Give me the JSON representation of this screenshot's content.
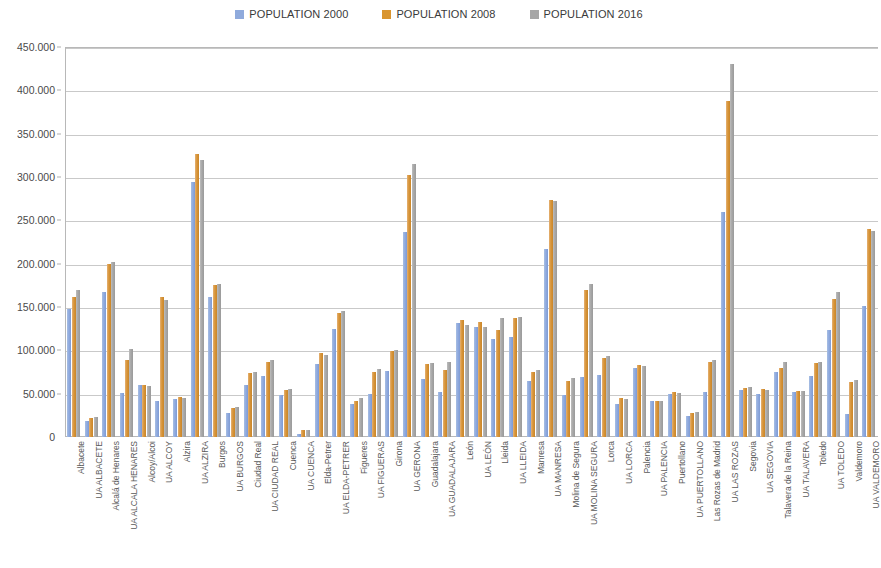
{
  "legend": {
    "position": "top-center",
    "entries": [
      {
        "label": "POPULATION 2000",
        "color": "#8FAADC"
      },
      {
        "label": "POPULATION 2008",
        "color": "#D9952F"
      },
      {
        "label": "POPULATION 2016",
        "color": "#A6A6A6"
      }
    ]
  },
  "axis": {
    "y_ticks": [
      "0",
      "50.000",
      "100.000",
      "150.000",
      "200.000",
      "250.000",
      "300.000",
      "350.000",
      "400.000",
      "450.000"
    ]
  },
  "chart_data": {
    "type": "bar",
    "title": "",
    "subtitle": "",
    "xlabel": "",
    "ylabel": "",
    "ylim": [
      0,
      450000
    ],
    "ytick_step": 50000,
    "grid": true,
    "legend_position": "top-center",
    "note": "Grouped (clustered) column chart. Spanish urban areas (UA = Urban Area) with population for three census years. Rightmost group UA VALDEMORO is clipped by the image edge.",
    "categories": [
      "Albacete",
      "UA ALBACETE",
      "Alcalá de Henares",
      "UA ALCALA HENARES",
      "Alcoy/Alcoi",
      "UA ALCOY",
      "Alzira",
      "UA ALZIRA",
      "Burgos",
      "UA BURGOS",
      "Ciudad Real",
      "UA CIUDAD REAL",
      "Cuenca",
      "UA CUENCA",
      "Elda-Petrer",
      "UA ELDA-PETRER",
      "Figueres",
      "UA FIGUERAS",
      "Girona",
      "UA GERONA",
      "Guadalajara",
      "UA GUADALAJARA",
      "León",
      "UA LEÓN",
      "Lleida",
      "UA LLEIDA",
      "Manresa",
      "UA MANRESA",
      "Molina de Segura",
      "UA MOLINA SEGURA",
      "Lorca",
      "UA LORCA",
      "Palencia",
      "UA PALENCIA",
      "Puertollano",
      "UA PUERTOLLANO",
      "Las Rozas de Madrid",
      "UA LAS ROZAS",
      "Segovia",
      "UA SEGOVIA",
      "Talavera de la Reina",
      "UA TALAVERA",
      "Toledo",
      "UA TOLEDO",
      "Valdemoro",
      "UA VALDEMORO"
    ],
    "series": [
      {
        "name": "POPULATION 2000",
        "color": "#8FAADC",
        "values": [
          148000,
          18000,
          167000,
          51000,
          60000,
          42000,
          44000,
          294000,
          162000,
          28000,
          60000,
          70000,
          48000,
          4000,
          84000,
          125000,
          38000,
          50000,
          76000,
          236000,
          67000,
          52000,
          131000,
          127000,
          113000,
          115000,
          65000,
          217000,
          48000,
          69000,
          72000,
          38000,
          80000,
          42000,
          50000,
          24000,
          52000,
          260000,
          54000,
          50000,
          75000,
          52000,
          70000,
          124000,
          27000,
          151000
        ]
      },
      {
        "name": "POPULATION 2008",
        "color": "#D9952F",
        "values": [
          162000,
          22000,
          200000,
          89000,
          60000,
          162000,
          46000,
          326000,
          175000,
          33000,
          74000,
          86000,
          54000,
          8000,
          97000,
          143000,
          42000,
          75000,
          99000,
          302000,
          84000,
          77000,
          135000,
          133000,
          124000,
          137000,
          75000,
          273000,
          65000,
          170000,
          91000,
          45000,
          83000,
          41000,
          52000,
          28000,
          86000,
          388000,
          57000,
          55000,
          80000,
          53000,
          85000,
          159000,
          63000,
          240000
        ]
      },
      {
        "name": "POPULATION 2016",
        "color": "#A6A6A6",
        "values": [
          170000,
          23000,
          202000,
          102000,
          59000,
          158000,
          45000,
          320000,
          177000,
          35000,
          75000,
          89000,
          55000,
          8000,
          95000,
          145000,
          45000,
          79000,
          100000,
          315000,
          85000,
          87000,
          129000,
          127000,
          137000,
          139000,
          77000,
          272000,
          68000,
          177000,
          94000,
          44000,
          82000,
          41000,
          51000,
          29000,
          89000,
          430000,
          58000,
          54000,
          87000,
          53000,
          86000,
          167000,
          66000,
          238000
        ]
      }
    ]
  }
}
